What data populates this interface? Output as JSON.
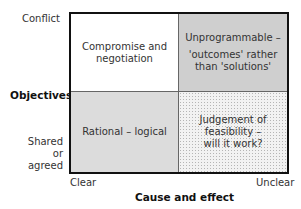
{
  "y_axis": {
    "title": "Objectives",
    "top_label": "Conflict",
    "bottom_label": [
      "Shared",
      "or",
      "agreed"
    ]
  },
  "x_axis": {
    "title": "Cause and effect",
    "left_label": "Clear",
    "right_label": "Unclear"
  },
  "quadrants": {
    "top_left": {
      "lines": [
        "Compromise and",
        "negotiation"
      ],
      "fill": "#ffffff"
    },
    "top_right": {
      "lines": [
        "Unprogrammable –",
        "'outcomes' rather",
        "than 'solutions'"
      ],
      "fill": "#cfcfcf"
    },
    "bottom_left": {
      "lines": [
        "Rational – logical"
      ],
      "fill": "#dcdcdc"
    },
    "bottom_right": {
      "lines": [
        "Judgement of",
        "feasibility –",
        "will it work?"
      ],
      "fill": "dotted"
    }
  }
}
